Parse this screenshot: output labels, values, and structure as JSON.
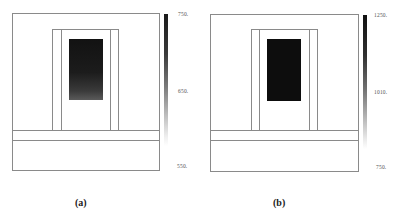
{
  "figure": {
    "panels": [
      {
        "id": "a",
        "caption": "(a)",
        "colorbar": {
          "max_label": "750.",
          "mid_label": "650.",
          "min_label": "550.",
          "top_color": "#1a1a1a",
          "bottom_color": "#ffffff"
        },
        "core_fill": "gradient-dark-to-gray"
      },
      {
        "id": "b",
        "caption": "(b)",
        "colorbar": {
          "max_label": "1250.",
          "mid_label": "1010.",
          "min_label": "750.",
          "top_color": "#111111",
          "bottom_color": "#ffffff"
        },
        "core_fill": "solid-black"
      }
    ],
    "colors": {
      "outline": "#8a8a8a",
      "core_dark": "#111111",
      "background": "#ffffff"
    }
  }
}
